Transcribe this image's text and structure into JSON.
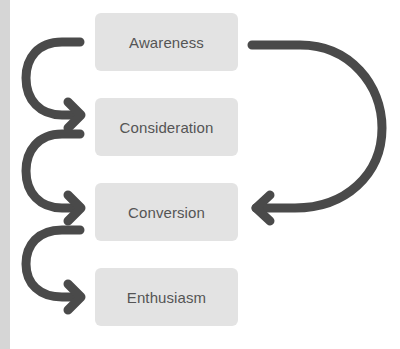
{
  "diagram": {
    "type": "flow",
    "stages": [
      {
        "label": "Awareness"
      },
      {
        "label": "Consideration"
      },
      {
        "label": "Conversion"
      },
      {
        "label": "Enthusiasm"
      }
    ],
    "arrows": [
      {
        "from": "Awareness",
        "to": "Consideration",
        "side": "left"
      },
      {
        "from": "Consideration",
        "to": "Conversion",
        "side": "left"
      },
      {
        "from": "Conversion",
        "to": "Enthusiasm",
        "side": "left"
      },
      {
        "from": "Awareness",
        "to": "Conversion",
        "side": "right"
      }
    ],
    "colors": {
      "box_fill": "#e3e3e3",
      "box_text": "#555555",
      "arrow": "#4a4a4a",
      "left_strip": "#d6d6d6"
    }
  }
}
